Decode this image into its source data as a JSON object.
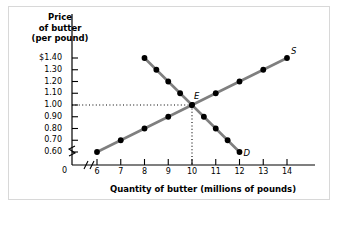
{
  "chart_data": {
    "type": "line",
    "title": "",
    "ylabel": "Price of butter (per pound)",
    "ylabel_lines": [
      "Price",
      "of butter",
      "(per pound)"
    ],
    "xlabel": "Quantity of butter (millions of pounds)",
    "yticks": [
      "$1.40",
      "1.30",
      "1.20",
      "1.10",
      "1.00",
      "0.90",
      "0.80",
      "0.70",
      "0.60"
    ],
    "ytick_values": [
      1.4,
      1.3,
      1.2,
      1.1,
      1.0,
      0.9,
      0.8,
      0.7,
      0.6
    ],
    "xticks": [
      "6",
      "7",
      "8",
      "9",
      "10",
      "11",
      "12",
      "13",
      "14"
    ],
    "xtick_values": [
      6,
      7,
      8,
      9,
      10,
      11,
      12,
      13,
      14
    ],
    "origin_label": "0",
    "xlim": [
      6,
      14
    ],
    "ylim": [
      0.6,
      1.4
    ],
    "axis_break_x": true,
    "axis_break_y": true,
    "grid": false,
    "legend": "none",
    "series": [
      {
        "name": "S",
        "label": "S",
        "description": "Supply curve",
        "x": [
          6,
          7,
          8,
          9,
          10,
          11,
          12,
          13,
          14
        ],
        "values": [
          0.6,
          0.7,
          0.8,
          0.9,
          1.0,
          1.1,
          1.2,
          1.3,
          1.4
        ]
      },
      {
        "name": "D",
        "label": "D",
        "description": "Demand curve",
        "x": [
          8,
          8.5,
          9,
          9.5,
          10,
          10.5,
          11,
          11.5,
          12
        ],
        "values": [
          1.4,
          1.3,
          1.2,
          1.1,
          1.0,
          0.9,
          0.8,
          0.7,
          0.6
        ]
      }
    ],
    "annotations": [
      {
        "label": "E",
        "name": "equilibrium-point",
        "x": 10,
        "y": 1.0,
        "guides": "dotted"
      }
    ],
    "colors": {
      "line": "#7f7f7f",
      "point": "#000000",
      "axis": "#000000",
      "guide": "#000000",
      "frame": "#d8d8d8"
    }
  }
}
